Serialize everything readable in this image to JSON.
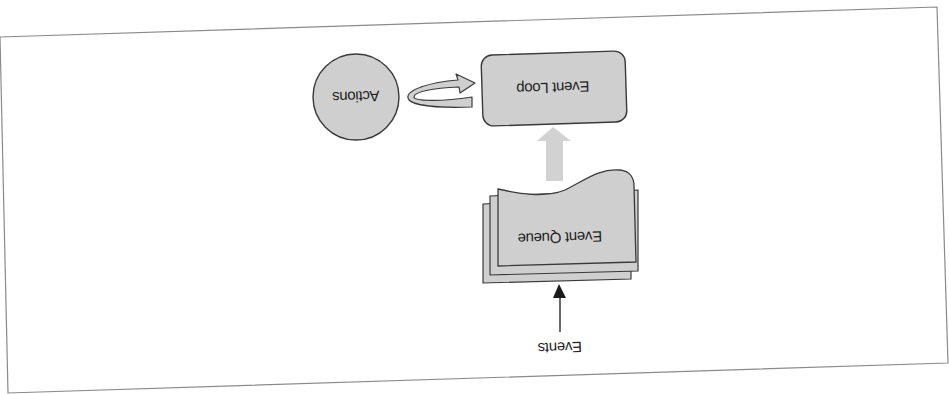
{
  "diagram": {
    "orientation": "upside-down (rotated ~180deg, slight tilt)",
    "colors": {
      "frame": "#8a8a8a",
      "node_fill": "#cfcfcf",
      "node_stroke": "#3a3a3a",
      "flow_arrow": "#d2d2d2",
      "event_arrow": "#1a1a1a",
      "text": "#1e1e1e"
    },
    "nodes": {
      "actions": {
        "label": "Actions",
        "shape": "circle"
      },
      "event_loop": {
        "label": "Event Loop",
        "shape": "rounded-rectangle"
      },
      "event_queue": {
        "label": "Event Queue",
        "shape": "stacked-documents"
      },
      "events": {
        "label": "Events",
        "shape": "text"
      }
    },
    "edges": [
      {
        "from": "events",
        "to": "event_queue",
        "style": "thin black arrow"
      },
      {
        "from": "event_queue",
        "to": "event_loop",
        "style": "thick gray block arrow"
      },
      {
        "from": "event_loop",
        "to": "actions",
        "style": "curved loop arrow"
      }
    ]
  }
}
